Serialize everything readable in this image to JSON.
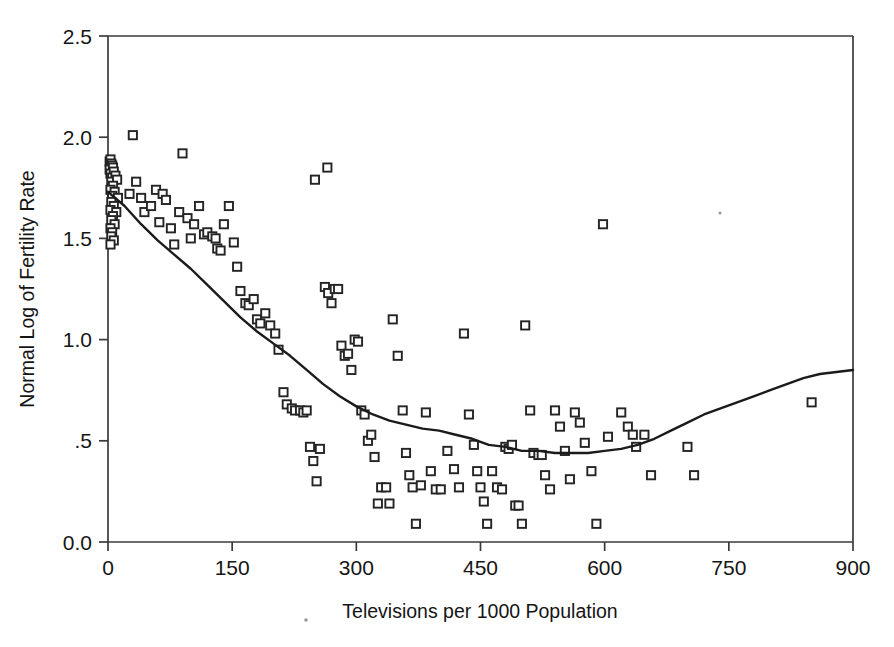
{
  "figure": {
    "background_color": "#ffffff",
    "marker_color": "#242424",
    "curve_color": "#1b1b1b",
    "axis_color": "#3a3a3a"
  },
  "chart_data": {
    "type": "scatter",
    "title": "",
    "subtitle": "",
    "xlabel": "Televisions per 1000 Population",
    "ylabel": "Normal Log of Fertility Rate",
    "xlim": [
      0,
      900
    ],
    "ylim": [
      0.0,
      2.5
    ],
    "grid": false,
    "legend": null,
    "xticks": [
      0,
      150,
      300,
      450,
      600,
      750,
      900
    ],
    "xticklabels": [
      "0",
      "150",
      "300",
      "450",
      "600",
      "750",
      "900"
    ],
    "yticks": [
      0.0,
      0.5,
      1.0,
      1.5,
      2.0,
      2.5
    ],
    "yticklabels": [
      "0.0",
      ".5",
      "1.0",
      "1.5",
      "2.0",
      "2.5"
    ],
    "marker_shape": "open-square",
    "point_count": 164,
    "series": [
      {
        "name": "Countries",
        "type": "scatter",
        "points": [
          [
            2,
            1.88
          ],
          [
            3,
            1.89
          ],
          [
            4,
            1.87
          ],
          [
            5,
            1.86
          ],
          [
            2,
            1.84
          ],
          [
            6,
            1.85
          ],
          [
            3,
            1.82
          ],
          [
            7,
            1.83
          ],
          [
            5,
            1.8
          ],
          [
            9,
            1.81
          ],
          [
            4,
            1.78
          ],
          [
            11,
            1.79
          ],
          [
            6,
            1.76
          ],
          [
            3,
            1.74
          ],
          [
            8,
            1.73
          ],
          [
            5,
            1.71
          ],
          [
            12,
            1.7
          ],
          [
            4,
            1.68
          ],
          [
            7,
            1.66
          ],
          [
            3,
            1.64
          ],
          [
            10,
            1.63
          ],
          [
            6,
            1.61
          ],
          [
            4,
            1.59
          ],
          [
            8,
            1.57
          ],
          [
            3,
            1.55
          ],
          [
            5,
            1.53
          ],
          [
            4,
            1.51
          ],
          [
            7,
            1.49
          ],
          [
            3,
            1.47
          ],
          [
            30,
            2.01
          ],
          [
            26,
            1.72
          ],
          [
            34,
            1.78
          ],
          [
            40,
            1.7
          ],
          [
            44,
            1.63
          ],
          [
            52,
            1.66
          ],
          [
            58,
            1.74
          ],
          [
            62,
            1.58
          ],
          [
            66,
            1.72
          ],
          [
            70,
            1.69
          ],
          [
            76,
            1.55
          ],
          [
            80,
            1.47
          ],
          [
            86,
            1.63
          ],
          [
            90,
            1.92
          ],
          [
            96,
            1.6
          ],
          [
            100,
            1.5
          ],
          [
            104,
            1.57
          ],
          [
            110,
            1.66
          ],
          [
            116,
            1.52
          ],
          [
            120,
            1.53
          ],
          [
            126,
            1.51
          ],
          [
            130,
            1.5
          ],
          [
            132,
            1.45
          ],
          [
            136,
            1.44
          ],
          [
            140,
            1.57
          ],
          [
            146,
            1.66
          ],
          [
            152,
            1.48
          ],
          [
            156,
            1.36
          ],
          [
            160,
            1.24
          ],
          [
            166,
            1.18
          ],
          [
            170,
            1.17
          ],
          [
            176,
            1.2
          ],
          [
            180,
            1.1
          ],
          [
            184,
            1.08
          ],
          [
            190,
            1.13
          ],
          [
            196,
            1.07
          ],
          [
            202,
            1.03
          ],
          [
            206,
            0.95
          ],
          [
            212,
            0.74
          ],
          [
            216,
            0.68
          ],
          [
            222,
            0.66
          ],
          [
            226,
            0.65
          ],
          [
            232,
            0.65
          ],
          [
            236,
            0.64
          ],
          [
            240,
            0.65
          ],
          [
            244,
            0.47
          ],
          [
            248,
            0.4
          ],
          [
            252,
            0.3
          ],
          [
            256,
            0.46
          ],
          [
            250,
            1.79
          ],
          [
            265,
            1.85
          ],
          [
            262,
            1.26
          ],
          [
            266,
            1.23
          ],
          [
            270,
            1.18
          ],
          [
            274,
            1.25
          ],
          [
            278,
            1.25
          ],
          [
            282,
            0.97
          ],
          [
            286,
            0.92
          ],
          [
            290,
            0.93
          ],
          [
            294,
            0.85
          ],
          [
            298,
            1.0
          ],
          [
            302,
            0.99
          ],
          [
            306,
            0.65
          ],
          [
            310,
            0.63
          ],
          [
            314,
            0.5
          ],
          [
            318,
            0.53
          ],
          [
            322,
            0.42
          ],
          [
            326,
            0.19
          ],
          [
            330,
            0.27
          ],
          [
            336,
            0.27
          ],
          [
            340,
            0.19
          ],
          [
            344,
            1.1
          ],
          [
            350,
            0.92
          ],
          [
            356,
            0.65
          ],
          [
            360,
            0.44
          ],
          [
            364,
            0.33
          ],
          [
            368,
            0.27
          ],
          [
            372,
            0.09
          ],
          [
            378,
            0.28
          ],
          [
            384,
            0.64
          ],
          [
            390,
            0.35
          ],
          [
            396,
            0.26
          ],
          [
            402,
            0.26
          ],
          [
            410,
            0.45
          ],
          [
            418,
            0.36
          ],
          [
            424,
            0.27
          ],
          [
            430,
            1.03
          ],
          [
            436,
            0.63
          ],
          [
            442,
            0.48
          ],
          [
            446,
            0.35
          ],
          [
            450,
            0.27
          ],
          [
            454,
            0.2
          ],
          [
            458,
            0.09
          ],
          [
            464,
            0.35
          ],
          [
            470,
            0.27
          ],
          [
            476,
            0.26
          ],
          [
            480,
            0.47
          ],
          [
            484,
            0.46
          ],
          [
            488,
            0.48
          ],
          [
            492,
            0.18
          ],
          [
            496,
            0.18
          ],
          [
            500,
            0.09
          ],
          [
            504,
            1.07
          ],
          [
            510,
            0.65
          ],
          [
            514,
            0.44
          ],
          [
            520,
            0.43
          ],
          [
            524,
            0.43
          ],
          [
            528,
            0.33
          ],
          [
            534,
            0.26
          ],
          [
            540,
            0.65
          ],
          [
            546,
            0.57
          ],
          [
            552,
            0.45
          ],
          [
            558,
            0.31
          ],
          [
            564,
            0.64
          ],
          [
            570,
            0.59
          ],
          [
            576,
            0.49
          ],
          [
            584,
            0.35
          ],
          [
            590,
            0.09
          ],
          [
            598,
            1.57
          ],
          [
            604,
            0.52
          ],
          [
            620,
            0.64
          ],
          [
            628,
            0.57
          ],
          [
            634,
            0.53
          ],
          [
            638,
            0.47
          ],
          [
            648,
            0.53
          ],
          [
            656,
            0.33
          ],
          [
            700,
            0.47
          ],
          [
            708,
            0.33
          ],
          [
            850,
            0.69
          ]
        ]
      },
      {
        "name": "Lowess smoother",
        "type": "line",
        "points": [
          [
            0,
            1.73
          ],
          [
            20,
            1.66
          ],
          [
            40,
            1.57
          ],
          [
            60,
            1.49
          ],
          [
            80,
            1.42
          ],
          [
            100,
            1.35
          ],
          [
            120,
            1.27
          ],
          [
            140,
            1.19
          ],
          [
            160,
            1.11
          ],
          [
            180,
            1.04
          ],
          [
            200,
            0.98
          ],
          [
            220,
            0.92
          ],
          [
            240,
            0.85
          ],
          [
            260,
            0.78
          ],
          [
            280,
            0.72
          ],
          [
            300,
            0.67
          ],
          [
            320,
            0.63
          ],
          [
            340,
            0.6
          ],
          [
            360,
            0.58
          ],
          [
            380,
            0.56
          ],
          [
            400,
            0.55
          ],
          [
            420,
            0.53
          ],
          [
            440,
            0.51
          ],
          [
            460,
            0.48
          ],
          [
            480,
            0.47
          ],
          [
            500,
            0.45
          ],
          [
            520,
            0.45
          ],
          [
            540,
            0.44
          ],
          [
            560,
            0.44
          ],
          [
            580,
            0.44
          ],
          [
            600,
            0.45
          ],
          [
            620,
            0.46
          ],
          [
            640,
            0.48
          ],
          [
            660,
            0.51
          ],
          [
            680,
            0.55
          ],
          [
            700,
            0.59
          ],
          [
            720,
            0.63
          ],
          [
            740,
            0.66
          ],
          [
            760,
            0.69
          ],
          [
            780,
            0.72
          ],
          [
            800,
            0.75
          ],
          [
            820,
            0.78
          ],
          [
            840,
            0.81
          ],
          [
            860,
            0.83
          ],
          [
            880,
            0.84
          ],
          [
            900,
            0.85
          ]
        ]
      }
    ]
  }
}
